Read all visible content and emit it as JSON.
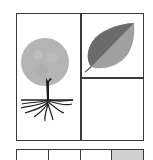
{
  "puzzle": {
    "main_grid": {
      "cells": [
        {
          "position": "left-tall",
          "content": "tree-with-roots"
        },
        {
          "position": "top-right",
          "content": "leaf"
        },
        {
          "position": "bottom-right",
          "content": "empty"
        }
      ]
    },
    "options_row": {
      "cells": [
        {
          "index": 1,
          "content": "empty"
        },
        {
          "index": 2,
          "content": "empty"
        },
        {
          "index": 3,
          "content": "empty"
        },
        {
          "index": 4,
          "content": "gray-fill"
        }
      ]
    },
    "colors": {
      "border": "#3a3a3a",
      "canopy": "#b4b4b4",
      "leaf_dark": "#6b6b6b",
      "leaf_light": "#a0a0a0",
      "trunk": "#1e1e1e",
      "option_gray": "#d0d0d0"
    }
  }
}
